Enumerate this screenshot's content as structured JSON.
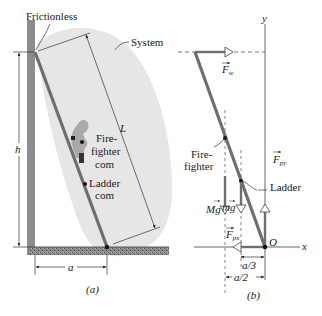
{
  "figure": {
    "panel_a": {
      "caption": "(a)",
      "labels": {
        "frictionless": "Frictionless",
        "system": "System",
        "length": "L",
        "height": "h",
        "distance": "a",
        "firefighter_com_line1": "Fire-",
        "firefighter_com_line2": "fighter",
        "firefighter_com_line3": "com",
        "ladder_com_line1": "Ladder",
        "ladder_com_line2": "com"
      }
    },
    "panel_b": {
      "caption": "(b)",
      "labels": {
        "y_axis": "y",
        "x_axis": "x",
        "origin": "O",
        "force_wall": "F",
        "force_wall_sub": "w",
        "force_py": "F",
        "force_py_sub": "py",
        "force_px": "F",
        "force_px_sub": "px",
        "firefighter_line1": "Fire-",
        "firefighter_line2": "fighter",
        "ladder": "Ladder",
        "weight_firefighter": "Mg",
        "weight_ladder": "mg",
        "dim_a3": "a/3",
        "dim_a2": "a/2"
      }
    },
    "colors": {
      "system_region": "#e6e6e6",
      "wall": "#8c8c8c",
      "ladder": "#6e6e6e",
      "floor": "#7a7a7a",
      "firefighter": "#a9a9a9",
      "line": "#333333"
    }
  }
}
